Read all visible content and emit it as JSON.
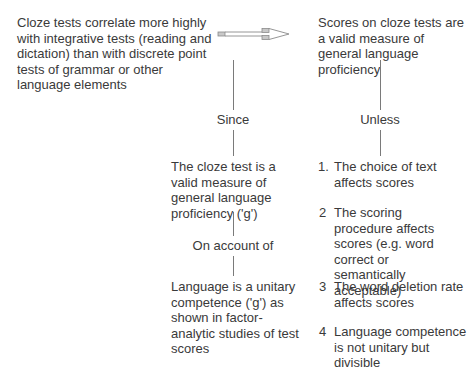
{
  "diagram": {
    "data_claim": "Cloze tests correlate more highly with integrative tests (reading and dictation) than with discrete point tests of grammar or other language elements",
    "conclusion": "Scores on cloze tests are a valid measure of general language proficiency",
    "arrow_icon": "right-arrow",
    "warrant_connector": "Since",
    "warrant": "The cloze test is a valid measure of general language proficiency ('g')",
    "backing_connector": "On account of",
    "backing": "Language is a unitary competence ('g') as shown in factor-analytic studies of test scores",
    "rebuttal_connector": "Unless",
    "rebuttals": [
      {
        "number": "1.",
        "text": "The choice of text affects scores"
      },
      {
        "number": "2",
        "text": "The scoring procedure affects scores (e.g. word correct or semantically acceptable)"
      },
      {
        "number": "3",
        "text": "The word deletion rate affects scores"
      },
      {
        "number": "4",
        "text": "Language competence is not unitary but divisible"
      }
    ],
    "colors": {
      "text": "#3a3a3a",
      "line": "#7a7a7a",
      "arrow_fill": "#c8c8c8"
    }
  }
}
